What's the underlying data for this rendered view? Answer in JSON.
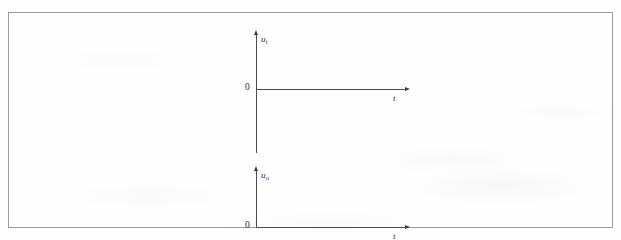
{
  "figure": {
    "top_caption": "",
    "frame": {
      "border_color": "#9a9a9e"
    }
  },
  "chart_data": [
    {
      "id": "input-waveform",
      "type": "line",
      "title": "",
      "xlabel": "t",
      "ylabel": "u",
      "ylabel_subscript": "i",
      "origin_label": "0",
      "grid": false,
      "legend": null,
      "series": [
        {
          "name": "u_i",
          "x": [],
          "values": []
        }
      ],
      "note": "Empty axes — no waveform plotted; blank grid for the student to draw the input voltage."
    },
    {
      "id": "output-waveform",
      "type": "line",
      "title": "",
      "xlabel": "t",
      "ylabel": "u",
      "ylabel_subscript": "o",
      "origin_label": "0",
      "grid": false,
      "legend": null,
      "series": [
        {
          "name": "u_o",
          "x": [],
          "values": []
        }
      ],
      "note": "Empty axes — no waveform plotted; blank grid for the student to draw the output voltage."
    }
  ],
  "plots": {
    "input": {
      "y_label": "u",
      "y_sub": "i",
      "x_label": "t",
      "origin": "0"
    },
    "output": {
      "y_label": "u",
      "y_sub": "o",
      "x_label": "t",
      "origin": "0"
    }
  }
}
